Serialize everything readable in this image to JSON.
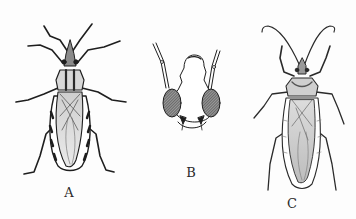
{
  "figure": {
    "panels": [
      {
        "id": "A",
        "label": "A",
        "subject": "dorsal-view-bug-a",
        "label_x": 69,
        "label_y": 186
      },
      {
        "id": "B",
        "label": "B",
        "subject": "head-detail",
        "label_x": 191,
        "label_y": 166
      },
      {
        "id": "C",
        "label": "C",
        "subject": "dorsal-view-bug-c",
        "label_x": 292,
        "label_y": 197
      }
    ],
    "colors": {
      "background": "#fdfdfd",
      "ink": "#1e1e1e",
      "shade": "#6e6e6e",
      "light_fill": "#e4e4e4"
    }
  }
}
